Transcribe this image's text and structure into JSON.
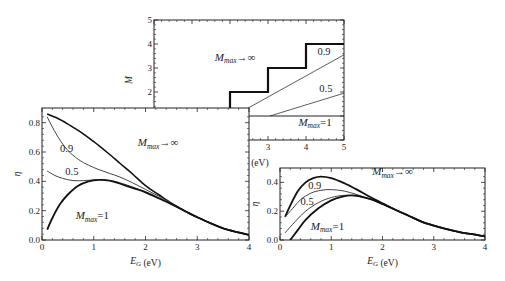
{
  "chart_data": [
    {
      "id": "top",
      "type": "line",
      "xlabel": "E/E_G (eV)",
      "ylabel": "M",
      "xlim": [
        0,
        5
      ],
      "ylim": [
        0,
        5
      ],
      "xticks": [
        0,
        1,
        2,
        3,
        4,
        5
      ],
      "yticks": [
        0,
        1,
        2,
        3,
        4,
        5
      ],
      "box": {
        "x0": 154,
        "x1": 344,
        "y0": 140,
        "y1": 20
      },
      "series": [
        {
          "name": "M_max→∞",
          "width": 2.2,
          "color": "#111111",
          "x": [
            0,
            1,
            1,
            2,
            2,
            3,
            3,
            4,
            4,
            5
          ],
          "y": [
            0,
            0,
            1,
            1,
            2,
            2,
            3,
            3,
            4,
            4
          ]
        },
        {
          "name": "0.9",
          "width": 0.8,
          "color": "#333333",
          "x": [
            2.1,
            5
          ],
          "y": [
            1,
            3.55
          ]
        },
        {
          "name": "0.5",
          "width": 0.8,
          "color": "#333333",
          "x": [
            3.05,
            5
          ],
          "y": [
            1,
            1.95
          ]
        },
        {
          "name": "M_max=1",
          "width": 1.0,
          "color": "#222222",
          "x": [
            1,
            5
          ],
          "y": [
            1,
            1
          ]
        }
      ],
      "annotations": [
        {
          "text_main": "M",
          "text_sub": "max",
          "text_tail": "→∞",
          "x": 1.6,
          "y": 3.3
        },
        {
          "text_main": "0.9",
          "x": 4.3,
          "y": 3.55
        },
        {
          "text_main": "0.5",
          "x": 4.35,
          "y": 2.0
        },
        {
          "text_main": "M",
          "text_sub": "max",
          "text_tail": "=1",
          "x": 3.8,
          "y": 0.6
        }
      ]
    },
    {
      "id": "left",
      "type": "line",
      "xlabel": "E_G (eV)",
      "ylabel": "η",
      "xlim": [
        0,
        4
      ],
      "ylim": [
        0,
        0.9
      ],
      "xticks": [
        0,
        1,
        2,
        3,
        4
      ],
      "yticks": [
        0.0,
        0.2,
        0.4,
        0.6,
        0.8
      ],
      "ytick_labels": [
        "0.0",
        "0.2",
        "0.4",
        "0.6",
        "0.8"
      ],
      "box": {
        "x0": 42,
        "x1": 249,
        "y0": 240,
        "y1": 108
      },
      "series": [
        {
          "name": "M_max→∞",
          "width": 1.6,
          "color": "#111111",
          "x": [
            0.1,
            0.3,
            0.5,
            0.75,
            1.0,
            1.25,
            1.5,
            1.75,
            2.0,
            2.25,
            2.5,
            2.75,
            3.0,
            3.25,
            3.5,
            3.75,
            4.0
          ],
          "y": [
            0.86,
            0.83,
            0.79,
            0.735,
            0.67,
            0.6,
            0.525,
            0.45,
            0.37,
            0.31,
            0.25,
            0.2,
            0.155,
            0.115,
            0.08,
            0.055,
            0.035
          ]
        },
        {
          "name": "0.9",
          "width": 1.0,
          "color": "#444444",
          "x": [
            0.1,
            0.2,
            0.35,
            0.5,
            0.7,
            0.9,
            1.1,
            1.3,
            1.5,
            1.75,
            2.0,
            2.25,
            2.5,
            2.75,
            3.0,
            3.25,
            3.5,
            3.75,
            4.0
          ],
          "y": [
            0.84,
            0.77,
            0.68,
            0.61,
            0.55,
            0.51,
            0.48,
            0.455,
            0.43,
            0.39,
            0.345,
            0.3,
            0.25,
            0.2,
            0.155,
            0.115,
            0.08,
            0.055,
            0.035
          ]
        },
        {
          "name": "0.5",
          "width": 1.0,
          "color": "#444444",
          "x": [
            0.1,
            0.25,
            0.4,
            0.6,
            0.8,
            1.0,
            1.2,
            1.4,
            1.6,
            1.8,
            2.0,
            2.25,
            2.5,
            2.75,
            3.0,
            3.25,
            3.5,
            3.75,
            4.0
          ],
          "y": [
            0.47,
            0.44,
            0.42,
            0.405,
            0.405,
            0.41,
            0.41,
            0.4,
            0.38,
            0.355,
            0.33,
            0.29,
            0.245,
            0.2,
            0.155,
            0.115,
            0.08,
            0.055,
            0.035
          ]
        },
        {
          "name": "M_max=1",
          "width": 1.8,
          "color": "#111111",
          "x": [
            0.1,
            0.2,
            0.35,
            0.5,
            0.7,
            0.9,
            1.1,
            1.3,
            1.5,
            1.75,
            2.0,
            2.25,
            2.5,
            2.75,
            3.0,
            3.25,
            3.5,
            3.75,
            4.0
          ],
          "y": [
            0.07,
            0.15,
            0.245,
            0.31,
            0.37,
            0.4,
            0.41,
            0.405,
            0.385,
            0.355,
            0.325,
            0.285,
            0.245,
            0.2,
            0.155,
            0.115,
            0.08,
            0.055,
            0.035
          ]
        }
      ],
      "annotations": [
        {
          "text_main": "M",
          "text_sub": "max",
          "text_tail": "→∞",
          "x": 1.85,
          "y": 0.64
        },
        {
          "text_main": "0.9",
          "x": 0.35,
          "y": 0.6
        },
        {
          "text_main": "0.5",
          "x": 0.45,
          "y": 0.44
        },
        {
          "text_main": "M",
          "text_sub": "max",
          "text_tail": "=1",
          "x": 0.65,
          "y": 0.14
        }
      ]
    },
    {
      "id": "right",
      "type": "line",
      "xlabel": "E_G (eV)",
      "ylabel": "η",
      "xlim": [
        0,
        4
      ],
      "ylim": [
        0,
        0.5
      ],
      "xticks": [
        0,
        1,
        2,
        3,
        4
      ],
      "yticks": [
        0.0,
        0.2,
        0.4
      ],
      "ytick_labels": [
        "0.0",
        "0.2",
        "0.4"
      ],
      "box": {
        "x0": 280,
        "x1": 485,
        "y0": 240,
        "y1": 168
      },
      "series": [
        {
          "name": "M_max→∞",
          "width": 1.8,
          "color": "#111111",
          "x": [
            0.1,
            0.2,
            0.35,
            0.5,
            0.65,
            0.8,
            1.0,
            1.25,
            1.5,
            1.75,
            2.0,
            2.25,
            2.5,
            2.75,
            3.0,
            3.25,
            3.5,
            3.75,
            4.0
          ],
          "y": [
            0.16,
            0.24,
            0.34,
            0.4,
            0.43,
            0.44,
            0.43,
            0.395,
            0.35,
            0.3,
            0.255,
            0.21,
            0.17,
            0.13,
            0.1,
            0.075,
            0.055,
            0.04,
            0.025
          ]
        },
        {
          "name": "0.9",
          "width": 1.0,
          "color": "#444444",
          "x": [
            0.1,
            0.25,
            0.4,
            0.6,
            0.8,
            1.0,
            1.25,
            1.5,
            1.75,
            2.0,
            2.25,
            2.5,
            2.75,
            3.0,
            3.25,
            3.5,
            3.75,
            4.0
          ],
          "y": [
            0.16,
            0.22,
            0.28,
            0.325,
            0.345,
            0.35,
            0.34,
            0.315,
            0.285,
            0.25,
            0.21,
            0.17,
            0.13,
            0.1,
            0.075,
            0.055,
            0.04,
            0.025
          ]
        },
        {
          "name": "0.5",
          "width": 1.0,
          "color": "#444444",
          "x": [
            0.1,
            0.3,
            0.5,
            0.75,
            1.0,
            1.25,
            1.5,
            1.75,
            2.0,
            2.25,
            2.5,
            2.75,
            3.0,
            3.25,
            3.5,
            3.75,
            4.0
          ],
          "y": [
            0.05,
            0.13,
            0.2,
            0.26,
            0.295,
            0.31,
            0.305,
            0.285,
            0.25,
            0.21,
            0.17,
            0.13,
            0.1,
            0.075,
            0.055,
            0.04,
            0.025
          ]
        },
        {
          "name": "M_max=1",
          "width": 1.8,
          "color": "#111111",
          "x": [
            0.2,
            0.35,
            0.5,
            0.75,
            1.0,
            1.2,
            1.4,
            1.6,
            1.8,
            2.0,
            2.25,
            2.5,
            2.75,
            3.0,
            3.25,
            3.5,
            3.75,
            4.0
          ],
          "y": [
            0.0,
            0.07,
            0.14,
            0.22,
            0.275,
            0.3,
            0.31,
            0.3,
            0.28,
            0.25,
            0.21,
            0.17,
            0.13,
            0.1,
            0.075,
            0.055,
            0.04,
            0.025
          ]
        }
      ],
      "annotations": [
        {
          "text_main": "M",
          "text_sub": "max",
          "text_tail": "→∞",
          "x": 1.8,
          "y": 0.45
        },
        {
          "text_main": "0.9",
          "x": 0.55,
          "y": 0.355
        },
        {
          "text_main": "0.5",
          "x": 0.4,
          "y": 0.24
        },
        {
          "text_main": "M",
          "text_sub": "max",
          "text_tail": "=1",
          "x": 0.6,
          "y": 0.07
        }
      ]
    }
  ]
}
